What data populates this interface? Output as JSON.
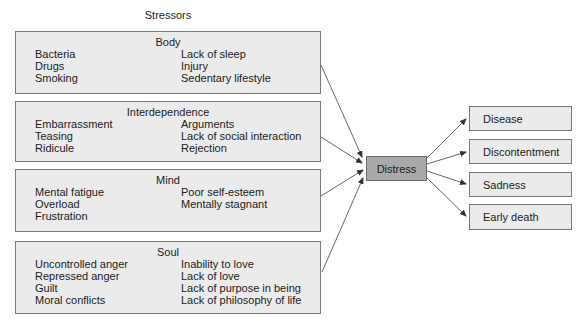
{
  "title": "Stressors",
  "stressors": [
    {
      "name": "Body",
      "left": [
        "Bacteria",
        "Drugs",
        "Smoking"
      ],
      "right": [
        "Lack of sleep",
        "Injury",
        "Sedentary lifestyle"
      ]
    },
    {
      "name": "Interdependence",
      "left": [
        "Embarrassment",
        "Teasing",
        "Ridicule"
      ],
      "right": [
        "Arguments",
        "Lack of social interaction",
        "Rejection"
      ]
    },
    {
      "name": "Mind",
      "left": [
        "Mental fatigue",
        "Overload",
        "Frustration"
      ],
      "right": [
        "Poor self-esteem",
        "Mentally stagnant"
      ]
    },
    {
      "name": "Soul",
      "left": [
        "Uncontrolled anger",
        "Repressed anger",
        "Guilt",
        "Moral conflicts"
      ],
      "right": [
        "Inability to love",
        "Lack of love",
        "Lack of purpose in being",
        "Lack of philosophy of life"
      ]
    }
  ],
  "center": "Distress",
  "outcomes": [
    "Disease",
    "Discontentment",
    "Sadness",
    "Early death"
  ],
  "colors": {
    "box_fill": "#ebebeb",
    "center_fill": "#a9a9a9",
    "border": "#7a7a7a",
    "arrow": "#333333"
  }
}
